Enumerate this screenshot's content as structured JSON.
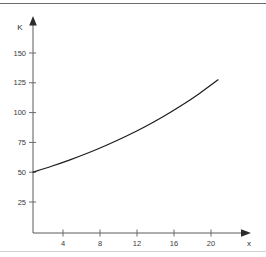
{
  "chart_data": {
    "type": "line",
    "title": "",
    "subtitle": "",
    "xlabel": "x",
    "ylabel": "K",
    "xlim": [
      0,
      24
    ],
    "ylim": [
      0,
      162
    ],
    "grid": false,
    "legend": null,
    "x_ticks": [
      4,
      8,
      12,
      16,
      20
    ],
    "y_ticks": [
      25,
      50,
      75,
      100,
      125,
      150
    ],
    "x_tick_labels": [
      "4",
      "8",
      "12",
      "16",
      "20"
    ],
    "y_tick_labels": [
      "25",
      "50",
      "75",
      "100",
      "125",
      "150"
    ],
    "series": [
      {
        "name": "K",
        "x": [
          0,
          2,
          4,
          6,
          8,
          10,
          12,
          14,
          16,
          18,
          20
        ],
        "values": [
          50.0,
          55.0,
          60.4,
          66.3,
          72.8,
          79.9,
          87.7,
          96.3,
          105.7,
          116.1,
          127.5
        ]
      }
    ],
    "annotations": [],
    "colors": {
      "curve": "#1d1d1d",
      "axis": "#5a5a5a",
      "tick_label": "#3a3a3a",
      "background": "#ffffff",
      "frame_top": "#6d6d6d",
      "frame_bottom": "#d2d2d2"
    }
  },
  "axes": {
    "y_axis_label": "K",
    "x_axis_label": "x"
  }
}
